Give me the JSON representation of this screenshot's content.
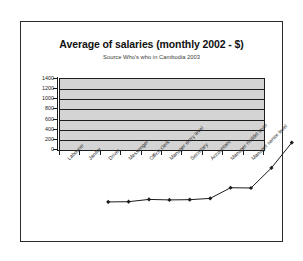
{
  "chart_data": {
    "type": "line",
    "title": "Average of salaries (monthly 2002 - $)",
    "subtitle": "Source Who's who in Cambodia 2003",
    "xlabel": "",
    "ylabel": "",
    "ylim": [
      0,
      1400
    ],
    "ytick_step": 200,
    "yticks": [
      1400,
      1200,
      1000,
      800,
      600,
      400,
      200,
      0
    ],
    "grid": true,
    "legend": "none",
    "marker": "diamond",
    "marker_color": "#1c1c1c",
    "line_color": "#1c1c1c",
    "plot_background": "#d4d4d4",
    "categories": [
      "Labourer",
      "Janitor",
      "Driver",
      "Messenger",
      "Office clerk",
      "Manager entry level",
      "Secretary",
      "Accountant",
      "Manager middel level",
      "Manager senior level"
    ],
    "values": [
      80,
      85,
      130,
      120,
      125,
      150,
      360,
      355,
      750,
      1250
    ]
  }
}
